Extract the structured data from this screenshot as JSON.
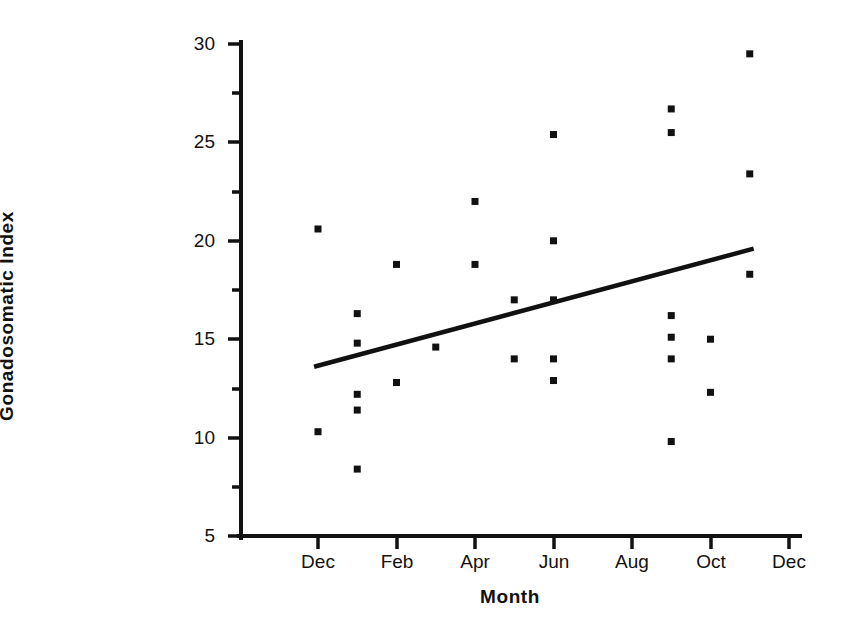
{
  "chart_data": {
    "type": "scatter",
    "title": "",
    "xlabel": "Month",
    "ylabel": "Gonadosomatic Index",
    "xlim": [
      10.2,
      24.6
    ],
    "ylim": [
      5,
      30
    ],
    "grid": false,
    "legend": null,
    "x_tick_labels": [
      "Dec",
      "Feb",
      "Apr",
      "Jun",
      "Aug",
      "Oct",
      "Dec"
    ],
    "x_tick_values": [
      12,
      14,
      16,
      18,
      20,
      22,
      24
    ],
    "y_tick_labels": [
      "5",
      "10",
      "15",
      "20",
      "25",
      "30"
    ],
    "y_tick_values": [
      5,
      10,
      15,
      20,
      25,
      30
    ],
    "y_minor_tick_values": [
      7.5,
      12.5,
      17.5,
      22.5,
      27.5
    ],
    "x_unit_note": "month index; 12 = Dec (year 1), 24 = Dec (year 2)",
    "points": [
      {
        "month": "Dec",
        "x": 12.0,
        "y": 20.6
      },
      {
        "month": "Dec",
        "x": 12.0,
        "y": 10.3
      },
      {
        "month": "Jan",
        "x": 13.0,
        "y": 16.3
      },
      {
        "month": "Jan",
        "x": 13.0,
        "y": 14.8
      },
      {
        "month": "Jan",
        "x": 13.0,
        "y": 12.2
      },
      {
        "month": "Jan",
        "x": 13.0,
        "y": 11.4
      },
      {
        "month": "Jan",
        "x": 13.0,
        "y": 8.4
      },
      {
        "month": "Feb",
        "x": 14.0,
        "y": 18.8
      },
      {
        "month": "Feb",
        "x": 14.0,
        "y": 12.8
      },
      {
        "month": "Mar",
        "x": 15.0,
        "y": 14.6
      },
      {
        "month": "Apr",
        "x": 16.0,
        "y": 22.0
      },
      {
        "month": "Apr",
        "x": 16.0,
        "y": 18.8
      },
      {
        "month": "May",
        "x": 17.0,
        "y": 17.0
      },
      {
        "month": "May",
        "x": 17.0,
        "y": 14.0
      },
      {
        "month": "Jun",
        "x": 18.0,
        "y": 25.4
      },
      {
        "month": "Jun",
        "x": 18.0,
        "y": 20.0
      },
      {
        "month": "Jun",
        "x": 18.0,
        "y": 17.0
      },
      {
        "month": "Jun",
        "x": 18.0,
        "y": 14.0
      },
      {
        "month": "Jun",
        "x": 18.0,
        "y": 12.9
      },
      {
        "month": "Sep",
        "x": 21.0,
        "y": 26.7
      },
      {
        "month": "Sep",
        "x": 21.0,
        "y": 25.5
      },
      {
        "month": "Sep",
        "x": 21.0,
        "y": 16.2
      },
      {
        "month": "Sep",
        "x": 21.0,
        "y": 15.1
      },
      {
        "month": "Sep",
        "x": 21.0,
        "y": 14.0
      },
      {
        "month": "Sep",
        "x": 21.0,
        "y": 9.8
      },
      {
        "month": "Oct",
        "x": 22.0,
        "y": 15.0
      },
      {
        "month": "Oct",
        "x": 22.0,
        "y": 12.3
      },
      {
        "month": "Nov",
        "x": 23.0,
        "y": 29.5
      },
      {
        "month": "Nov",
        "x": 23.0,
        "y": 23.4
      },
      {
        "month": "Nov",
        "x": 23.0,
        "y": 18.3
      }
    ],
    "trend_line": {
      "type": "linear-fit",
      "x_start": 11.9,
      "y_start": 13.6,
      "x_end": 23.1,
      "y_end": 19.6
    }
  }
}
